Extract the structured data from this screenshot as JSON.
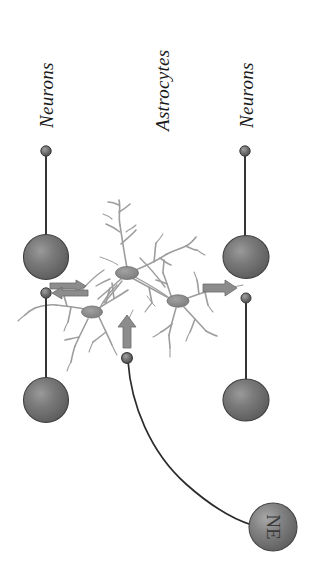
{
  "figure": {
    "title_visible": false,
    "background_color": "#ffffff",
    "labels": {
      "left_neurons": "Neurons",
      "astrocytes": "Astrocytes",
      "right_neurons": "Neurons",
      "ne_sphere": "NE"
    },
    "colors": {
      "sphere_fill": "#6e6e6e",
      "sphere_edge": "#3a3a3a",
      "sphere_highlight": "#8f8f8f",
      "arrow_fill": "#8c8c8c",
      "arrow_edge": "#5a5a5a",
      "astrocyte_process": "#9a9a9a",
      "astrocyte_soma": "#8a8a8a",
      "axon_line": "#2b2b2b",
      "terminal_fill": "#6b6b6b",
      "label_text": "#1a1a1a"
    },
    "elements": {
      "neuron_somas": 4,
      "neuron_terminals": 4,
      "astrocyte_somas": 3,
      "arrows": 4,
      "ne_neuron": 1
    }
  },
  "chart_data": {
    "type": "diagram",
    "nodes": [
      {
        "id": "n1_top_terminal",
        "type": "neuron-terminal",
        "column": "left",
        "x": 46,
        "y": 151
      },
      {
        "id": "n1_soma",
        "type": "neuron-soma",
        "column": "left",
        "x": 46,
        "y": 257
      },
      {
        "id": "n1_bottom_terminal",
        "type": "neuron-terminal",
        "column": "left",
        "x": 46,
        "y": 293
      },
      {
        "id": "n2_soma",
        "type": "neuron-soma",
        "column": "left",
        "x": 46,
        "y": 400
      },
      {
        "id": "n3_top_terminal",
        "type": "neuron-terminal",
        "column": "right",
        "x": 245,
        "y": 151
      },
      {
        "id": "n3_soma",
        "type": "neuron-soma",
        "column": "right",
        "x": 246,
        "y": 257
      },
      {
        "id": "n3_bottom_terminal",
        "type": "neuron-terminal",
        "column": "right",
        "x": 246,
        "y": 298
      },
      {
        "id": "n4_soma",
        "type": "neuron-soma",
        "column": "right",
        "x": 246,
        "y": 400
      },
      {
        "id": "astro_a",
        "type": "astrocyte-soma",
        "column": "center",
        "x": 127,
        "y": 273
      },
      {
        "id": "astro_b",
        "type": "astrocyte-soma",
        "column": "center",
        "x": 92,
        "y": 312
      },
      {
        "id": "astro_c",
        "type": "astrocyte-soma",
        "column": "center",
        "x": 178,
        "y": 301
      },
      {
        "id": "ne_terminal",
        "type": "neuron-terminal",
        "column": "center",
        "x": 127,
        "y": 358
      },
      {
        "id": "ne_soma",
        "type": "ne-neuron-soma",
        "column": "bottom-right",
        "x": 273,
        "y": 527,
        "label": "NE"
      }
    ],
    "edges": [
      {
        "from": "n1_bottom_terminal",
        "to": "astrocyte-network",
        "direction": "right",
        "kind": "arrow"
      },
      {
        "from": "astrocyte-network",
        "to": "n1_bottom_terminal",
        "direction": "left",
        "kind": "arrow"
      },
      {
        "from": "astrocyte-network",
        "to": "n3_bottom_terminal",
        "direction": "right",
        "kind": "arrow"
      },
      {
        "from": "ne_terminal",
        "to": "astrocyte-network",
        "direction": "up",
        "kind": "arrow"
      },
      {
        "from": "ne_soma",
        "to": "ne_terminal",
        "direction": "curve",
        "kind": "axon"
      }
    ]
  }
}
